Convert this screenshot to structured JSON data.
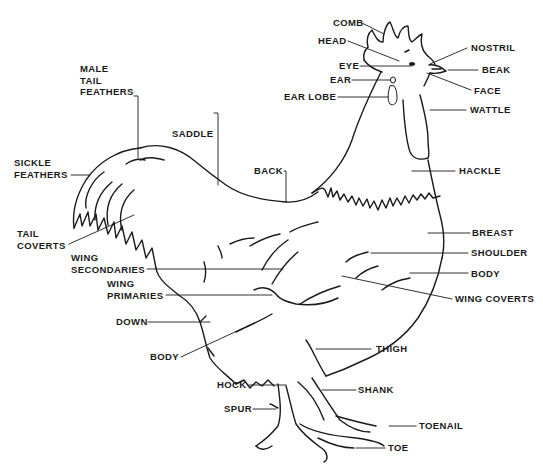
{
  "diagram": {
    "style": "black line art on white",
    "colors": {
      "ink": "#1a1a1a",
      "background": "#ffffff"
    },
    "labels": {
      "comb": "COMB",
      "head": "HEAD",
      "nostril": "NOSTRIL",
      "eye": "EYE",
      "beak": "BEAK",
      "ear": "EAR",
      "face": "FACE",
      "ear_lobe": "EAR LOBE",
      "wattle": "WATTLE",
      "male_tail_feathers": "MALE\nTAIL\nFEATHERS",
      "saddle": "SADDLE",
      "sickle_feathers": "SICKLE\nFEATHERS",
      "back": "BACK",
      "hackle": "HACKLE",
      "tail_coverts": "TAIL\nCOVERTS",
      "breast": "BREAST",
      "wing_secondaries": "WING\nSECONDARIES",
      "shoulder": "SHOULDER",
      "wing_primaries": "WING\nPRIMARIES",
      "body_right": "BODY",
      "wing_coverts": "WING COVERTS",
      "down": "DOWN",
      "body_left": "BODY",
      "thigh": "THIGH",
      "hock": "HOCK",
      "shank": "SHANK",
      "spur": "SPUR",
      "toenail": "TOENAIL",
      "toe": "TOE"
    }
  }
}
